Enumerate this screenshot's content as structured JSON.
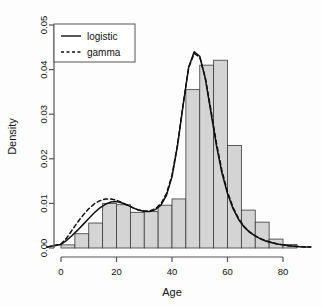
{
  "chart_data": {
    "type": "bar",
    "title": "",
    "subtitle": "",
    "xlabel": "Age",
    "ylabel": "Density",
    "xlim": [
      -5,
      90
    ],
    "ylim": [
      0.0,
      0.05
    ],
    "grid": false,
    "x_ticks": [
      0,
      20,
      40,
      60,
      80
    ],
    "x_tick_labels": [
      "0",
      "20",
      "40",
      "60",
      "80"
    ],
    "y_ticks": [
      0.0,
      0.01,
      0.02,
      0.03,
      0.04,
      0.05
    ],
    "y_tick_labels": [
      "0.00",
      "0.01",
      "0.02",
      "0.03",
      "0.04",
      "0.05"
    ],
    "histogram": {
      "bin_width": 5,
      "bin_edges": [
        0,
        5,
        10,
        15,
        20,
        25,
        30,
        35,
        40,
        45,
        50,
        55,
        60,
        65,
        70,
        75,
        80
      ],
      "densities": [
        0.0007,
        0.0032,
        0.0056,
        0.01,
        0.0097,
        0.008,
        0.0082,
        0.0096,
        0.011,
        0.0355,
        0.041,
        0.0421,
        0.023,
        0.0085,
        0.0058,
        0.002,
        0.0008
      ],
      "fill_color": "#d4d4d4",
      "edge_color": "#3a3a3a"
    },
    "series": [
      {
        "name": "logistic",
        "style": "solid",
        "color": "#111111",
        "x": [
          -5,
          0,
          2,
          4,
          6,
          8,
          10,
          12,
          14,
          16,
          18,
          20,
          22,
          24,
          26,
          28,
          30,
          32,
          34,
          36,
          38,
          40,
          42,
          44,
          46,
          48,
          50,
          52,
          54,
          56,
          58,
          60,
          62,
          64,
          66,
          68,
          70,
          72,
          74,
          76,
          78,
          80,
          82,
          84,
          86,
          88,
          90
        ],
        "y": [
          0.0002,
          0.0008,
          0.0017,
          0.0028,
          0.004,
          0.0053,
          0.0066,
          0.0079,
          0.009,
          0.0098,
          0.0103,
          0.0104,
          0.0101,
          0.0096,
          0.009,
          0.0085,
          0.0082,
          0.0082,
          0.0086,
          0.0096,
          0.0118,
          0.016,
          0.023,
          0.032,
          0.0405,
          0.044,
          0.043,
          0.038,
          0.0305,
          0.023,
          0.0168,
          0.0122,
          0.0088,
          0.0064,
          0.0047,
          0.0035,
          0.0027,
          0.002,
          0.0015,
          0.0012,
          0.0009,
          0.0007,
          0.0005,
          0.0004,
          0.0003,
          0.0002,
          0.0002
        ]
      },
      {
        "name": "gamma",
        "style": "dashed",
        "color": "#111111",
        "x": [
          -5,
          0,
          2,
          4,
          6,
          8,
          10,
          12,
          14,
          16,
          18,
          20,
          22,
          24,
          26,
          28,
          30,
          32,
          34,
          36,
          38,
          40,
          42,
          44,
          46,
          48,
          50,
          52,
          54,
          56,
          58,
          60,
          62,
          64,
          66,
          68,
          70,
          72,
          74,
          76,
          78,
          80,
          82,
          84,
          86,
          88,
          90
        ],
        "y": [
          0.0002,
          0.0009,
          0.0022,
          0.004,
          0.0058,
          0.0074,
          0.0088,
          0.0099,
          0.0106,
          0.011,
          0.011,
          0.0107,
          0.0102,
          0.0096,
          0.009,
          0.0085,
          0.0083,
          0.0083,
          0.0088,
          0.0099,
          0.0122,
          0.0163,
          0.0232,
          0.0322,
          0.0404,
          0.0436,
          0.0428,
          0.0382,
          0.031,
          0.0236,
          0.0173,
          0.0126,
          0.0091,
          0.0066,
          0.0048,
          0.0036,
          0.0027,
          0.0021,
          0.0016,
          0.0012,
          0.0009,
          0.0007,
          0.0005,
          0.0004,
          0.0003,
          0.0002,
          0.0002
        ]
      }
    ],
    "legend": {
      "position": "top-left",
      "entries": [
        {
          "label": "logistic",
          "style": "solid"
        },
        {
          "label": "gamma",
          "style": "dashed"
        }
      ]
    }
  }
}
